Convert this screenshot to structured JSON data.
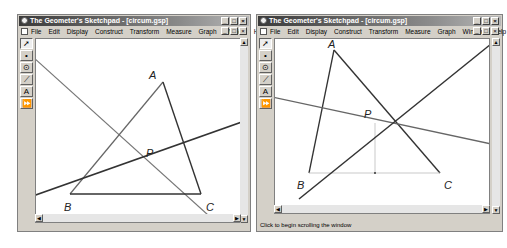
{
  "windows": [
    {
      "title": "The Geometer's Sketchpad - [circum.gsp]",
      "menu": [
        "File",
        "Edit",
        "Display",
        "Construct",
        "Transform",
        "Measure",
        "Graph",
        "Window",
        "Help"
      ],
      "tools": [
        "arrow",
        "point",
        "compass",
        "line",
        "text",
        "custom"
      ],
      "status": "",
      "points": {
        "A": "A",
        "B": "B",
        "C": "C",
        "P": "P"
      }
    },
    {
      "title": "The Geometer's Sketchpad - [circum.gsp]",
      "menu": [
        "File",
        "Edit",
        "Display",
        "Construct",
        "Transform",
        "Measure",
        "Graph",
        "Window",
        "Help"
      ],
      "tools": [
        "arrow",
        "point",
        "compass",
        "line",
        "text",
        "custom"
      ],
      "status": "Click to begin scrolling the window",
      "points": {
        "A": "A",
        "B": "B",
        "C": "C",
        "P": "P"
      }
    }
  ],
  "window_buttons": {
    "minimize": "_",
    "maximize": "□",
    "close": "×"
  },
  "tool_glyphs": {
    "arrow": "➚",
    "point": "•",
    "compass": "⊙",
    "line": "⟋",
    "text": "A",
    "custom": "⏩"
  },
  "colors": {
    "titlebar": "#3a3a3a",
    "chrome": "#d4d0c8",
    "line_dark": "#333333",
    "line_gray": "#777777"
  }
}
